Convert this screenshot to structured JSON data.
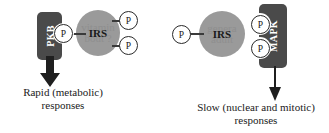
{
  "left_pathway": {
    "effector": {
      "label": "PKB"
    },
    "phospho_docking": {
      "label": "P"
    },
    "substrate": {
      "label": "IRS",
      "watermark": "vitamin\nbout ?"
    },
    "phospho_sites": [
      {
        "label": "P"
      },
      {
        "label": "P"
      }
    ],
    "caption": "Rapid (metabolic)\nresponses"
  },
  "right_pathway": {
    "substrate": {
      "label": "IRS",
      "watermark": "genera\nadult"
    },
    "phospho_upstream": {
      "label": "P"
    },
    "phospho_docking": [
      {
        "label": "P"
      },
      {
        "label": "P"
      }
    ],
    "effector": {
      "label": "MAPK"
    },
    "caption": "Slow (nuclear and mitotic)\nresponses"
  },
  "colors": {
    "effector_box": "#4a4a4a",
    "substrate_ellipse": "#9a9a9a",
    "phospho_circle_fill": "#ffffff",
    "outline": "#2a2a2a",
    "text": "#1a1a1a",
    "watermark": "#8b8b8b",
    "background": "#ffffff"
  }
}
